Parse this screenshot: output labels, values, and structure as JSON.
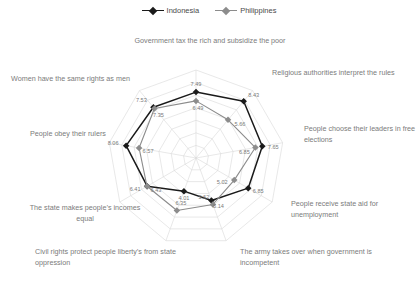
{
  "legend": {
    "items": [
      {
        "label": "Indonesia",
        "color": "#1a1a1a"
      },
      {
        "label": "Philippines",
        "color": "#8c8c8c"
      }
    ]
  },
  "chart_data": {
    "type": "radar",
    "title": "",
    "grid": true,
    "legend_position": "top",
    "rlim": [
      0,
      10
    ],
    "rings": 7,
    "categories": [
      "Government tax the rich and subsidize the poor",
      "Religious authorities interpret the rules",
      "People choose their leaders in free elections",
      "People receive state aid for unemployment",
      "The army takes over when government is incompetent",
      "Civil rights protect people liberty’s from state oppression",
      "The state makes people’s incomes equal",
      "People obey their rulers",
      "Women have the same rights as men"
    ],
    "series": [
      {
        "name": "Indonesia",
        "color": "#1a1a1a",
        "values": [
          7.49,
          8.43,
          7.65,
          6.85,
          5.14,
          4.01,
          6.41,
          8.06,
          7.53
        ]
      },
      {
        "name": "Philippines",
        "color": "#8c8c8c",
        "values": [
          6.49,
          5.66,
          6.85,
          5.02,
          5.62,
          6.35,
          6.43,
          6.57,
          7.35
        ]
      }
    ],
    "data_labels": [
      {
        "text": "7.49",
        "series": "Indonesia",
        "category": "Government tax the rich and subsidize the poor"
      },
      {
        "text": "6.49",
        "series": "Philippines",
        "category": "Government tax the rich and subsidize the poor"
      },
      {
        "text": "8.43",
        "series": "Indonesia",
        "category": "Religious authorities interpret the rules"
      },
      {
        "text": "5.66",
        "series": "Philippines",
        "category": "Religious authorities interpret the rules"
      },
      {
        "text": "7.65",
        "series": "Indonesia",
        "category": "People choose their leaders in free elections"
      },
      {
        "text": "6.85",
        "series": "Philippines",
        "category": "People choose their leaders in free elections"
      },
      {
        "text": "6.85",
        "series": "Indonesia",
        "category": "People receive state aid for unemployment"
      },
      {
        "text": "5.02",
        "series": "Philippines",
        "category": "People receive state aid for unemployment"
      },
      {
        "text": "5.14",
        "series": "Indonesia",
        "category": "The army takes over when government is incompetent"
      },
      {
        "text": "5.62",
        "series": "Philippines",
        "category": "The army takes over when government is incompetent"
      },
      {
        "text": "4.01",
        "series": "Indonesia",
        "category": "Civil rights protect people liberty’s from state oppression"
      },
      {
        "text": "6.35",
        "series": "Philippines",
        "category": "Civil rights protect people liberty’s from state oppression"
      },
      {
        "text": "6.41",
        "series": "Indonesia",
        "category": "The state makes people’s incomes equal"
      },
      {
        "text": "6.43",
        "series": "Philippines",
        "category": "The state makes people’s incomes equal"
      },
      {
        "text": "8.06",
        "series": "Indonesia",
        "category": "People obey their rulers"
      },
      {
        "text": "6.57",
        "series": "Philippines",
        "category": "People obey their rulers"
      },
      {
        "text": "7.53",
        "series": "Indonesia",
        "category": "Women have the same rights as men"
      },
      {
        "text": "7.35",
        "series": "Philippines",
        "category": "Women have the same rights as men"
      }
    ]
  },
  "axis_labels": [
    {
      "id": "axis-label-tax-rich",
      "text": "Government tax the rich and subsidize the poor"
    },
    {
      "id": "axis-label-religious-authorities",
      "text": "Religious authorities interpret the rules"
    },
    {
      "id": "axis-label-free-elections",
      "text": "People choose their leaders in free elections"
    },
    {
      "id": "axis-label-state-aid",
      "text": "People receive state aid for unemployment"
    },
    {
      "id": "axis-label-army-takes-over",
      "text": "The army takes over when government is incompetent"
    },
    {
      "id": "axis-label-civil-rights",
      "text": "Civil rights protect people liberty’s from state oppression"
    },
    {
      "id": "axis-label-incomes-equal",
      "text": "The state makes people’s incomes equal"
    },
    {
      "id": "axis-label-obey-rulers",
      "text": "People obey their rulers"
    },
    {
      "id": "axis-label-women-rights",
      "text": "Women have the same rights as men"
    }
  ],
  "colors": {
    "grid": "#d9d9d9",
    "indonesia": "#1a1a1a",
    "philippines": "#8c8c8c",
    "label_text": "#7b7b7b"
  }
}
